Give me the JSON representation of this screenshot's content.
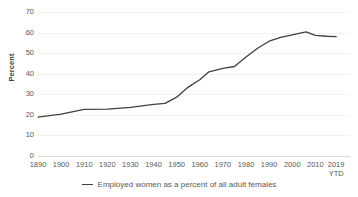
{
  "chart_data": {
    "type": "line",
    "title": "",
    "xlabel": "",
    "ylabel": "Percent",
    "ylim": [
      0,
      70
    ],
    "ytick_step": 10,
    "yticks": [
      "70",
      "60",
      "50",
      "40",
      "30",
      "20",
      "10",
      "0"
    ],
    "grid": true,
    "legend_position": "bottom",
    "xticks": [
      {
        "l1": "1890",
        "l2": ""
      },
      {
        "l1": "1900",
        "l2": ""
      },
      {
        "l1": "1910",
        "l2": ""
      },
      {
        "l1": "1920",
        "l2": ""
      },
      {
        "l1": "1930",
        "l2": ""
      },
      {
        "l1": "1940",
        "l2": ""
      },
      {
        "l1": "1950",
        "l2": ""
      },
      {
        "l1": "1960",
        "l2": ""
      },
      {
        "l1": "1970",
        "l2": ""
      },
      {
        "l1": "1980",
        "l2": ""
      },
      {
        "l1": "1990",
        "l2": ""
      },
      {
        "l1": "2000",
        "l2": ""
      },
      {
        "l1": "2010",
        "l2": ""
      },
      {
        "l1": "2019",
        "l2": "YTD"
      }
    ],
    "xlim": [
      1890,
      2025
    ],
    "series": [
      {
        "name": "Employed women as a percent of all adult females",
        "color": "#404040",
        "x": [
          1890,
          1900,
          1910,
          1920,
          1930,
          1940,
          1945,
          1950,
          1955,
          1960,
          1964,
          1970,
          1975,
          1980,
          1985,
          1990,
          1995,
          2000,
          2006,
          2010,
          2015,
          2019
        ],
        "values": [
          18.9,
          20.4,
          22.7,
          22.8,
          23.6,
          25.1,
          25.6,
          28.6,
          33.5,
          37.1,
          40.9,
          42.6,
          43.5,
          48.1,
          52.4,
          55.8,
          57.7,
          58.9,
          60.3,
          58.6,
          58.2,
          58.0
        ]
      }
    ]
  },
  "legend": {
    "swatch": "line-swatch",
    "label": "Employed women as a percent of all adult females"
  }
}
